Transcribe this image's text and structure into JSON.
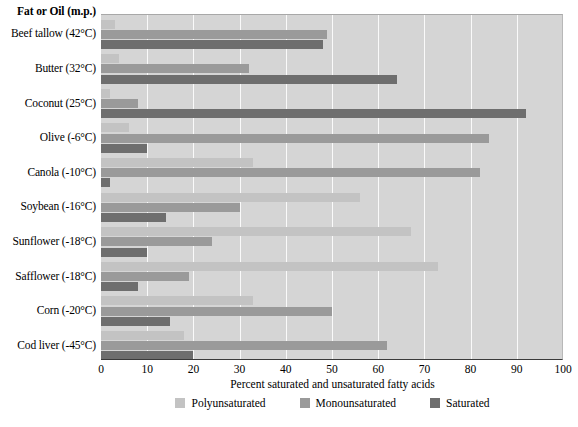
{
  "header": {
    "category_axis_title": "Fat or Oil (m.p.)"
  },
  "axis": {
    "xlabel": "Percent saturated and unsaturated fatty acids",
    "ticks": [
      "0",
      "10",
      "20",
      "30",
      "40",
      "50",
      "60",
      "70",
      "80",
      "90",
      "100"
    ]
  },
  "legend": [
    {
      "label": "Polyunsaturated",
      "color": "#c3c3c3"
    },
    {
      "label": "Monounsaturated",
      "color": "#9a9a9a"
    },
    {
      "label": "Saturated",
      "color": "#6e6e6e"
    }
  ],
  "chart_data": {
    "type": "bar",
    "orientation": "horizontal",
    "title": "",
    "xlabel": "Percent saturated and unsaturated fatty acids",
    "ylabel": "Fat or Oil (m.p.)",
    "xlim": [
      0,
      100
    ],
    "xticks": [
      0,
      10,
      20,
      30,
      40,
      50,
      60,
      70,
      80,
      90,
      100
    ],
    "grid": "vertical-only",
    "legend_position": "bottom-center",
    "categories": [
      "Beef tallow (42°C)",
      "Butter (32°C)",
      "Coconut (25°C)",
      "Olive (-6°C)",
      "Canola (-10°C)",
      "Soybean (-16°C)",
      "Sunflower (-18°C)",
      "Safflower (-18°C)",
      "Corn (-20°C)",
      "Cod liver (-45°C)"
    ],
    "series": [
      {
        "name": "Polyunsaturated",
        "color": "#c3c3c3",
        "values": [
          3,
          4,
          2,
          6,
          33,
          56,
          67,
          73,
          33,
          18
        ]
      },
      {
        "name": "Monounsaturated",
        "color": "#9a9a9a",
        "values": [
          49,
          32,
          8,
          84,
          82,
          30,
          24,
          19,
          50,
          62
        ]
      },
      {
        "name": "Saturated",
        "color": "#6e6e6e",
        "values": [
          48,
          64,
          92,
          10,
          2,
          14,
          10,
          8,
          15,
          20
        ]
      }
    ]
  }
}
